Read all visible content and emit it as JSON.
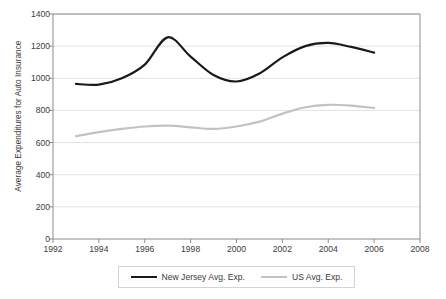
{
  "chart_data": {
    "type": "line",
    "title": "",
    "xlabel": "",
    "ylabel": "Average Expenditures for Auto Insurance",
    "xlim": [
      1992,
      2008
    ],
    "ylim": [
      0,
      1400
    ],
    "grid": true,
    "legend_position": "bottom",
    "x": [
      1993,
      1994,
      1995,
      1996,
      1997,
      1998,
      1999,
      2000,
      2001,
      2002,
      2003,
      2004,
      2005,
      2006
    ],
    "xticks": [
      "1992",
      "1994",
      "1996",
      "1998",
      "2000",
      "2002",
      "2004",
      "2006",
      "2008"
    ],
    "xtick_values": [
      1992,
      1994,
      1996,
      1998,
      2000,
      2002,
      2004,
      2006,
      2008
    ],
    "yticks": [
      "0",
      "200",
      "400",
      "600",
      "800",
      "1000",
      "1200",
      "1400"
    ],
    "ytick_values": [
      0,
      200,
      400,
      600,
      800,
      1000,
      1200,
      1400
    ],
    "series": [
      {
        "name": "New Jersey Avg. Exp.",
        "color": "#1a1a1a",
        "values": [
          965,
          960,
          1000,
          1085,
          1255,
          1135,
          1020,
          980,
          1030,
          1130,
          1200,
          1220,
          1195,
          1160
        ]
      },
      {
        "name": "US Avg. Exp.",
        "color": "#c2c2c2",
        "values": [
          640,
          665,
          685,
          700,
          705,
          695,
          685,
          700,
          730,
          780,
          820,
          835,
          830,
          815
        ]
      }
    ]
  },
  "legend": {
    "entries": [
      {
        "label": "New Jersey Avg. Exp."
      },
      {
        "label": "US Avg. Exp."
      }
    ]
  },
  "colors": {
    "new_jersey_line": "#1a1a1a",
    "us_line": "#c2c2c2",
    "gridline": "#e2e2e2",
    "axis": "#8c8c8c",
    "text": "#3b3b3b",
    "background": "#ffffff"
  }
}
